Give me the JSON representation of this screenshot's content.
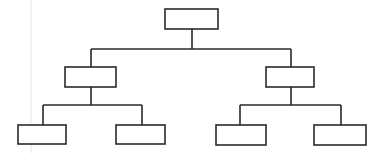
{
  "diagram": {
    "type": "tree",
    "title": "",
    "colors": {
      "stroke": "#2a2a2a",
      "fill": "#ffffff",
      "background": "#ffffff"
    },
    "nodes": [
      {
        "id": "root",
        "label": "",
        "level": 0,
        "parent": null
      },
      {
        "id": "left",
        "label": "",
        "level": 1,
        "parent": "root"
      },
      {
        "id": "right",
        "label": "",
        "level": 1,
        "parent": "root"
      },
      {
        "id": "left-left",
        "label": "",
        "level": 2,
        "parent": "left"
      },
      {
        "id": "left-right",
        "label": "",
        "level": 2,
        "parent": "left"
      },
      {
        "id": "right-left",
        "label": "",
        "level": 2,
        "parent": "right"
      },
      {
        "id": "right-right",
        "label": "",
        "level": 2,
        "parent": "right"
      }
    ]
  }
}
